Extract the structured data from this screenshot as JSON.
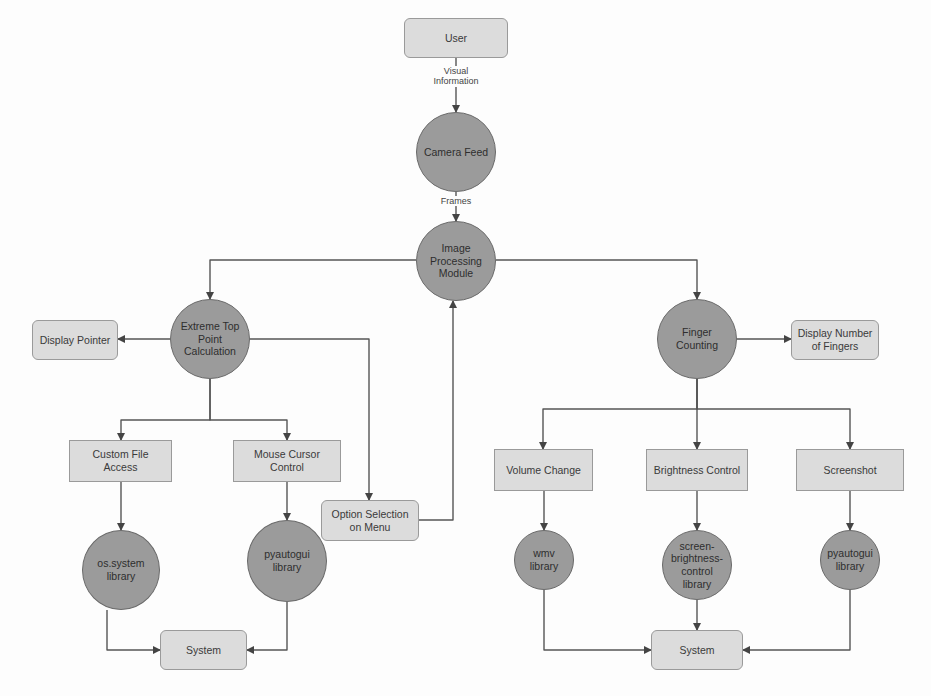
{
  "diagram": {
    "colors": {
      "rect_fill": "#dcdcdc",
      "circle_fill": "#9b9b9b",
      "line": "#555555",
      "background": "#fdfdfd"
    },
    "nodes": [
      {
        "id": "user",
        "label": "User",
        "shape": "rrect",
        "x": 404,
        "y": 18,
        "w": 104,
        "h": 40
      },
      {
        "id": "camera_feed",
        "label": "Camera Feed",
        "shape": "circle",
        "x": 416,
        "y": 112,
        "w": 80,
        "h": 80
      },
      {
        "id": "image_processing",
        "label": "Image\nProcessing\nModule",
        "shape": "circle",
        "x": 416,
        "y": 221,
        "w": 80,
        "h": 80
      },
      {
        "id": "extreme_top",
        "label": "Extreme Top\nPoint\nCalculation",
        "shape": "circle",
        "x": 170,
        "y": 299,
        "w": 80,
        "h": 80
      },
      {
        "id": "display_pointer",
        "label": "Display Pointer",
        "shape": "rrect",
        "x": 32,
        "y": 320,
        "w": 86,
        "h": 40
      },
      {
        "id": "custom_file",
        "label": "Custom File\nAccess",
        "shape": "rect",
        "x": 69,
        "y": 440,
        "w": 103,
        "h": 42
      },
      {
        "id": "mouse_cursor",
        "label": "Mouse Cursor\nControl",
        "shape": "rect",
        "x": 233,
        "y": 440,
        "w": 108,
        "h": 42
      },
      {
        "id": "option_selection",
        "label": "Option Selection\non Menu",
        "shape": "rrect",
        "x": 321,
        "y": 500,
        "w": 98,
        "h": 41
      },
      {
        "id": "os_system",
        "label": "os.system\nlibrary",
        "shape": "circle",
        "x": 82,
        "y": 530,
        "w": 78,
        "h": 80
      },
      {
        "id": "pyautogui_left",
        "label": "pyautogui\nlibrary",
        "shape": "circle",
        "x": 247,
        "y": 520,
        "w": 80,
        "h": 82
      },
      {
        "id": "system_left",
        "label": "System",
        "shape": "rrect",
        "x": 160,
        "y": 630,
        "w": 87,
        "h": 40
      },
      {
        "id": "finger_counting",
        "label": "Finger\nCounting",
        "shape": "circle",
        "x": 657,
        "y": 299,
        "w": 80,
        "h": 80
      },
      {
        "id": "display_fingers",
        "label": "Display Number\nof Fingers",
        "shape": "rrect",
        "x": 791,
        "y": 320,
        "w": 88,
        "h": 40
      },
      {
        "id": "volume_change",
        "label": "Volume Change",
        "shape": "rect",
        "x": 494,
        "y": 449,
        "w": 99,
        "h": 42
      },
      {
        "id": "brightness_control",
        "label": "Brightness Control",
        "shape": "rect",
        "x": 646,
        "y": 449,
        "w": 102,
        "h": 42
      },
      {
        "id": "screenshot",
        "label": "Screenshot",
        "shape": "rect",
        "x": 796,
        "y": 449,
        "w": 108,
        "h": 42
      },
      {
        "id": "wmv",
        "label": "wmv\nlibrary",
        "shape": "circle",
        "x": 514,
        "y": 530,
        "w": 60,
        "h": 60
      },
      {
        "id": "sbc",
        "label": "screen-\nbrightness-\ncontrol\nlibrary",
        "shape": "circle",
        "x": 662,
        "y": 530,
        "w": 70,
        "h": 70
      },
      {
        "id": "pyautogui_right",
        "label": "pyautogui\nlibrary",
        "shape": "circle",
        "x": 820,
        "y": 530,
        "w": 60,
        "h": 60
      },
      {
        "id": "system_right",
        "label": "System",
        "shape": "rrect",
        "x": 651,
        "y": 630,
        "w": 92,
        "h": 40
      }
    ],
    "edges": [
      {
        "from": "user",
        "to": "camera_feed",
        "label": "Visual\nInformation",
        "points": [
          [
            456,
            58
          ],
          [
            456,
            112
          ]
        ]
      },
      {
        "from": "camera_feed",
        "to": "image_processing",
        "label": "Frames",
        "points": [
          [
            456,
            192
          ],
          [
            456,
            221
          ]
        ]
      },
      {
        "from": "image_processing",
        "to": "extreme_top",
        "points": [
          [
            416,
            260
          ],
          [
            210,
            260
          ],
          [
            210,
            299
          ]
        ]
      },
      {
        "from": "image_processing",
        "to": "finger_counting",
        "points": [
          [
            496,
            260
          ],
          [
            697,
            260
          ],
          [
            697,
            299
          ]
        ]
      },
      {
        "from": "extreme_top",
        "to": "display_pointer",
        "points": [
          [
            170,
            339
          ],
          [
            118,
            339
          ]
        ]
      },
      {
        "from": "extreme_top",
        "to": "option_selection",
        "points": [
          [
            250,
            339
          ],
          [
            369,
            339
          ],
          [
            369,
            500
          ]
        ]
      },
      {
        "from": "extreme_top",
        "to": "custom_file",
        "points": [
          [
            210,
            379
          ],
          [
            210,
            420
          ],
          [
            121,
            420
          ],
          [
            121,
            440
          ]
        ]
      },
      {
        "from": "extreme_top",
        "to": "mouse_cursor",
        "points": [
          [
            210,
            379
          ],
          [
            210,
            420
          ],
          [
            287,
            420
          ],
          [
            287,
            440
          ]
        ]
      },
      {
        "from": "option_selection",
        "to": "image_processing",
        "points": [
          [
            419,
            520
          ],
          [
            453,
            520
          ],
          [
            453,
            301
          ]
        ]
      },
      {
        "from": "custom_file",
        "to": "os_system",
        "points": [
          [
            121,
            482
          ],
          [
            121,
            530
          ]
        ]
      },
      {
        "from": "mouse_cursor",
        "to": "pyautogui_left",
        "points": [
          [
            287,
            482
          ],
          [
            287,
            520
          ]
        ]
      },
      {
        "from": "os_system",
        "to": "system_left",
        "points": [
          [
            107,
            610
          ],
          [
            107,
            650
          ],
          [
            160,
            650
          ]
        ]
      },
      {
        "from": "pyautogui_left",
        "to": "system_left",
        "points": [
          [
            287,
            602
          ],
          [
            287,
            650
          ],
          [
            247,
            650
          ]
        ]
      },
      {
        "from": "finger_counting",
        "to": "display_fingers",
        "points": [
          [
            737,
            339
          ],
          [
            791,
            339
          ]
        ]
      },
      {
        "from": "finger_counting",
        "to": "volume_change",
        "points": [
          [
            697,
            379
          ],
          [
            697,
            409
          ],
          [
            543,
            409
          ],
          [
            543,
            449
          ]
        ]
      },
      {
        "from": "finger_counting",
        "to": "brightness_control",
        "points": [
          [
            697,
            379
          ],
          [
            697,
            449
          ]
        ]
      },
      {
        "from": "finger_counting",
        "to": "screenshot",
        "points": [
          [
            697,
            379
          ],
          [
            697,
            409
          ],
          [
            850,
            409
          ],
          [
            850,
            449
          ]
        ]
      },
      {
        "from": "volume_change",
        "to": "wmv",
        "points": [
          [
            544,
            491
          ],
          [
            544,
            530
          ]
        ]
      },
      {
        "from": "brightness_control",
        "to": "sbc",
        "points": [
          [
            697,
            491
          ],
          [
            697,
            530
          ]
        ]
      },
      {
        "from": "screenshot",
        "to": "pyautogui_right",
        "points": [
          [
            850,
            491
          ],
          [
            850,
            530
          ]
        ]
      },
      {
        "from": "wmv",
        "to": "system_right",
        "points": [
          [
            544,
            590
          ],
          [
            544,
            650
          ],
          [
            651,
            650
          ]
        ]
      },
      {
        "from": "sbc",
        "to": "system_right",
        "points": [
          [
            697,
            600
          ],
          [
            697,
            630
          ]
        ]
      },
      {
        "from": "pyautogui_right",
        "to": "system_right",
        "points": [
          [
            850,
            590
          ],
          [
            850,
            650
          ],
          [
            743,
            650
          ]
        ]
      }
    ],
    "edge_labels": [
      {
        "text": "Visual\nInformation",
        "x": 426,
        "y": 66,
        "w": 60
      },
      {
        "text": "Frames",
        "x": 431,
        "y": 196,
        "w": 50
      }
    ]
  },
  "caption": "Fig. 4: ... flow diagram (clipped)"
}
